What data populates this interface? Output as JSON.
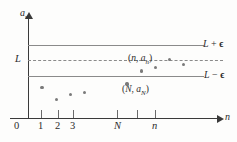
{
  "figure": {
    "axes": {
      "y_label": "a",
      "y_label_sub": "n",
      "x_label": "n",
      "origin_label": "0"
    },
    "reference_lines": [
      {
        "id": "upper",
        "label_L": "L",
        "label_op": " + ",
        "label_eps": "ϵ",
        "style": "solid",
        "y_value": "L + ϵ"
      },
      {
        "id": "limit",
        "label_L": "L",
        "label_op": "",
        "label_eps": "",
        "style": "dashed",
        "y_value": "L"
      },
      {
        "id": "lower",
        "label_L": "L",
        "label_op": " − ",
        "label_eps": "ϵ",
        "style": "solid",
        "y_value": "L − ϵ"
      }
    ],
    "line_labels": {
      "upper": "L + ϵ",
      "lower": "L − ϵ",
      "limit": "L"
    },
    "point_annotations": [
      {
        "id": "generic",
        "open": "(",
        "var1": "n",
        "comma": ", ",
        "var2": "a",
        "sub2": "n",
        "close": ")",
        "text": "(n, aₙ)"
      },
      {
        "id": "threshold",
        "open": "(",
        "var1": "N",
        "comma": ", ",
        "var2": "a",
        "sub2": "N",
        "close": ")",
        "text": "(N, aₙ)"
      }
    ],
    "x_ticks": [
      {
        "label": "0",
        "italic": false
      },
      {
        "label": "1",
        "italic": false
      },
      {
        "label": "2",
        "italic": false
      },
      {
        "label": "3",
        "italic": false
      },
      {
        "label": "N",
        "italic": true
      },
      {
        "label": "n",
        "italic": true
      }
    ],
    "colors": {
      "axis": "#3a3a3a",
      "line": "#8a8a8a",
      "point": "#7a7a7a",
      "text": "#2b2b2b",
      "background": "#fdfdfc"
    }
  },
  "chart_data": {
    "type": "scatter",
    "title": "",
    "xlabel": "n",
    "ylabel": "a_n",
    "grid": false,
    "legend": "none",
    "xlim": [
      0,
      13
    ],
    "ylim": [
      0,
      1
    ],
    "annotations": [
      "L + ϵ",
      "L",
      "L − ϵ",
      "(n, aₙ)",
      "(N, aₙ)"
    ],
    "reference_lines": [
      {
        "label": "L + ϵ",
        "y": 0.72,
        "style": "solid"
      },
      {
        "label": "L",
        "y": 0.575,
        "style": "dashed"
      },
      {
        "label": "L − ϵ",
        "y": 0.43,
        "style": "solid"
      }
    ],
    "x_tick_labels": [
      "0",
      "1",
      "2",
      "3",
      "N",
      "n"
    ],
    "x_tick_positions": [
      0,
      1,
      2,
      3,
      7,
      9
    ],
    "points": [
      {
        "x": 1,
        "y": 0.315
      },
      {
        "x": 2,
        "y": 0.19
      },
      {
        "x": 3,
        "y": 0.245
      },
      {
        "x": 4,
        "y": 0.265
      },
      {
        "x": 7,
        "y": 0.355,
        "label": "(N, aₙ)"
      },
      {
        "x": 8,
        "y": 0.49
      },
      {
        "x": 9,
        "y": 0.525
      },
      {
        "x": 10,
        "y": 0.61,
        "label": "(n, aₙ)"
      },
      {
        "x": 11,
        "y": 0.555
      }
    ]
  }
}
